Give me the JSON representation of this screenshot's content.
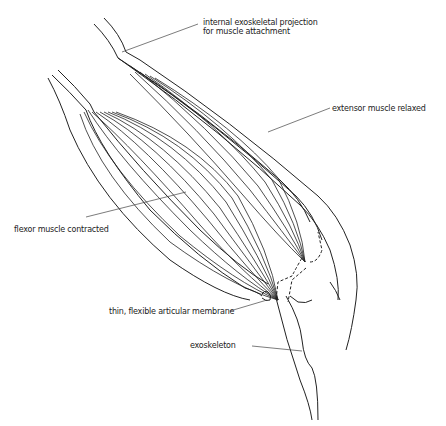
{
  "diagram": {
    "type": "anatomical line drawing",
    "labels": {
      "projection_line1": "internal exoskeletal projection",
      "projection_line2": "for muscle attachment",
      "extensor": "extensor muscle relaxed",
      "flexor": "flexor muscle contracted",
      "membrane": "thin, flexible articular membrane",
      "exoskeleton": "exoskeleton"
    },
    "colors": {
      "line": "#222222",
      "background": "#ffffff"
    }
  }
}
